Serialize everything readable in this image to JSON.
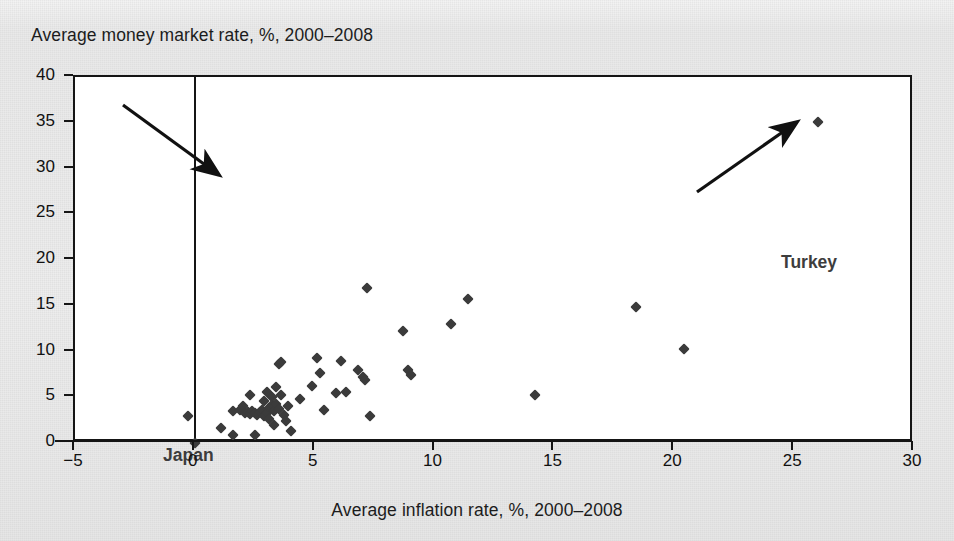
{
  "axes": {
    "y_title": "Average money market rate, %, 2000–2008",
    "x_title": "Average inflation rate, %, 2000–2008",
    "y_ticks": [
      "0",
      "5",
      "10",
      "15",
      "20",
      "25",
      "30",
      "35",
      "40"
    ],
    "x_ticks": [
      "−5",
      "0",
      "5",
      "10",
      "15",
      "20",
      "25",
      "30"
    ]
  },
  "annotations": {
    "japan": "Japan",
    "turkey": "Turkey"
  },
  "colors": {
    "marker": "#3b3b3b",
    "axis": "#151515",
    "plot_background": "#ffffff",
    "page_background": "#ebebeb",
    "annotation_text": "#3d3d3d"
  },
  "chart_data": {
    "type": "scatter",
    "title": "",
    "xlabel": "Average inflation rate, %, 2000–2008",
    "ylabel": "Average money market rate, %, 2000–2008",
    "xlim": [
      -5,
      30
    ],
    "ylim": [
      0,
      40
    ],
    "xticks": [
      -5,
      0,
      5,
      10,
      15,
      20,
      25,
      30
    ],
    "yticks": [
      0,
      5,
      10,
      15,
      20,
      25,
      30,
      35,
      40
    ],
    "grid": false,
    "legend": "none",
    "marker": "diamond",
    "annotations": [
      {
        "label": "Japan",
        "x": 0.0,
        "y": 0.0,
        "text_x": -3.7,
        "text_y": 7.8
      },
      {
        "label": "Turkey",
        "x": 26.0,
        "y": 35.1,
        "text_x": 21.5,
        "text_y": 27.5
      }
    ],
    "points": [
      {
        "x": -0.3,
        "y": 3.0
      },
      {
        "x": 0.0,
        "y": 0.0
      },
      {
        "x": 1.1,
        "y": 1.6
      },
      {
        "x": 1.6,
        "y": 3.5
      },
      {
        "x": 1.6,
        "y": 0.9
      },
      {
        "x": 1.9,
        "y": 3.6
      },
      {
        "x": 2.0,
        "y": 4.0
      },
      {
        "x": 2.1,
        "y": 3.3
      },
      {
        "x": 2.2,
        "y": 3.4
      },
      {
        "x": 2.3,
        "y": 3.2
      },
      {
        "x": 2.3,
        "y": 5.3
      },
      {
        "x": 2.4,
        "y": 3.5
      },
      {
        "x": 2.5,
        "y": 3.3
      },
      {
        "x": 2.5,
        "y": 0.9
      },
      {
        "x": 2.6,
        "y": 3.1
      },
      {
        "x": 2.7,
        "y": 3.4
      },
      {
        "x": 2.8,
        "y": 3.6
      },
      {
        "x": 2.9,
        "y": 4.6
      },
      {
        "x": 2.9,
        "y": 3.0
      },
      {
        "x": 3.0,
        "y": 3.3
      },
      {
        "x": 3.0,
        "y": 5.6
      },
      {
        "x": 3.1,
        "y": 3.8
      },
      {
        "x": 3.1,
        "y": 2.6
      },
      {
        "x": 3.2,
        "y": 4.2
      },
      {
        "x": 3.2,
        "y": 5.0
      },
      {
        "x": 3.3,
        "y": 3.5
      },
      {
        "x": 3.3,
        "y": 2.0
      },
      {
        "x": 3.4,
        "y": 6.1
      },
      {
        "x": 3.4,
        "y": 4.3
      },
      {
        "x": 3.5,
        "y": 3.7
      },
      {
        "x": 3.5,
        "y": 8.6
      },
      {
        "x": 3.6,
        "y": 8.8
      },
      {
        "x": 3.6,
        "y": 5.2
      },
      {
        "x": 3.7,
        "y": 3.1
      },
      {
        "x": 3.8,
        "y": 2.4
      },
      {
        "x": 3.9,
        "y": 4.0
      },
      {
        "x": 4.0,
        "y": 1.3
      },
      {
        "x": 4.4,
        "y": 4.8
      },
      {
        "x": 4.9,
        "y": 6.2
      },
      {
        "x": 5.1,
        "y": 9.3
      },
      {
        "x": 5.2,
        "y": 7.6
      },
      {
        "x": 5.4,
        "y": 3.6
      },
      {
        "x": 5.9,
        "y": 5.5
      },
      {
        "x": 6.1,
        "y": 9.0
      },
      {
        "x": 6.3,
        "y": 5.6
      },
      {
        "x": 6.8,
        "y": 8.0
      },
      {
        "x": 7.0,
        "y": 7.2
      },
      {
        "x": 7.1,
        "y": 6.9
      },
      {
        "x": 7.2,
        "y": 16.9
      },
      {
        "x": 7.3,
        "y": 3.0
      },
      {
        "x": 8.7,
        "y": 12.2
      },
      {
        "x": 8.9,
        "y": 8.0
      },
      {
        "x": 9.0,
        "y": 7.4
      },
      {
        "x": 10.7,
        "y": 13.0
      },
      {
        "x": 11.4,
        "y": 15.7
      },
      {
        "x": 14.2,
        "y": 5.3
      },
      {
        "x": 18.4,
        "y": 14.9
      },
      {
        "x": 20.4,
        "y": 10.3
      },
      {
        "x": 26.0,
        "y": 35.1
      }
    ]
  }
}
